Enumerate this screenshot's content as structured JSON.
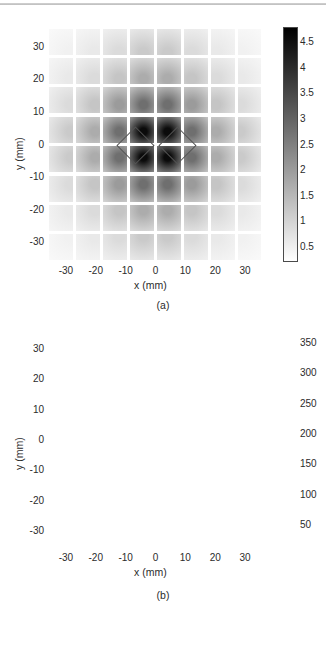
{
  "figure": {
    "width": 326,
    "height": 645,
    "background": "#ffffff"
  },
  "panels": [
    {
      "id": "a",
      "caption": "(a)",
      "xlabel": "x (mm)",
      "ylabel": "y (mm)",
      "xticks": [
        "-30",
        "-20",
        "-10",
        "0",
        "10",
        "20",
        "30"
      ],
      "xtick_values": [
        -30,
        -20,
        -10,
        0,
        10,
        20,
        30
      ],
      "yticks": [
        "30",
        "20",
        "10",
        "0",
        "-10",
        "-20",
        "-30"
      ],
      "ytick_values": [
        30,
        20,
        10,
        0,
        -10,
        -20,
        -30
      ],
      "colorbar": {
        "ticks": [
          "4.5",
          "4",
          "3.5",
          "3",
          "2.5",
          "2",
          "1.5",
          "1",
          "0.5"
        ],
        "tick_values": [
          4.5,
          4,
          3.5,
          3,
          2.5,
          2,
          1.5,
          1,
          0.5
        ],
        "min": 0.2,
        "max": 4.8,
        "low_color": "#ffffff",
        "high_color": "#000000",
        "orientation": "vertical"
      },
      "overlay": "two-diamond-outline",
      "overlay_color": "#555555"
    },
    {
      "id": "b",
      "caption": "(b)",
      "xlabel": "x (mm)",
      "ylabel": "y (mm)",
      "xticks": [
        "-30",
        "-20",
        "-10",
        "0",
        "10",
        "20",
        "30"
      ],
      "xtick_values": [
        -30,
        -20,
        -10,
        0,
        10,
        20,
        30
      ],
      "yticks": [
        "30",
        "20",
        "10",
        "0",
        "-10",
        "-20",
        "-30"
      ],
      "ytick_values": [
        30,
        20,
        10,
        0,
        -10,
        -20,
        -30
      ],
      "colorbar": {
        "ticks": [
          "350",
          "300",
          "250",
          "200",
          "150",
          "100",
          "50"
        ],
        "tick_values": [
          350,
          300,
          250,
          200,
          150,
          100,
          50
        ],
        "min": 10,
        "max": 370,
        "low_color": "#ffffff",
        "high_color": "#000000",
        "orientation": "vertical"
      },
      "overlay": "two-diamond-outline",
      "overlay_color": "#888888",
      "outside_field_color": "#000000",
      "field_radius_mm": 32
    }
  ],
  "chart_data": [
    {
      "type": "heatmap",
      "panel": "a",
      "title": "",
      "xlabel": "x (mm)",
      "ylabel": "y (mm)",
      "xlim": [
        -36,
        36
      ],
      "ylim": [
        -36,
        36
      ],
      "xticks": [
        -30,
        -20,
        -10,
        0,
        10,
        20,
        30
      ],
      "yticks": [
        -30,
        -20,
        -10,
        0,
        10,
        20,
        30
      ],
      "grid": false,
      "colorbar_label": "",
      "cmap": "gray_r",
      "clim": [
        0.2,
        4.8
      ],
      "block_grid": 8,
      "block_pitch_mm": 9.0,
      "block_gap_mm": 1.0,
      "comment": "8x8 array of detector blocks; intensity peaks at center and falls off radially",
      "x_centers_mm": [
        -31.5,
        -22.5,
        -13.5,
        -4.5,
        4.5,
        13.5,
        22.5,
        31.5
      ],
      "y_centers_mm": [
        31.5,
        22.5,
        13.5,
        4.5,
        -4.5,
        -13.5,
        -22.5,
        -31.5
      ],
      "values": [
        [
          0.45,
          0.6,
          0.85,
          1.15,
          1.15,
          0.85,
          0.6,
          0.45
        ],
        [
          0.6,
          0.85,
          1.25,
          1.7,
          1.7,
          1.25,
          0.85,
          0.6
        ],
        [
          0.85,
          1.25,
          2.0,
          2.8,
          2.8,
          2.0,
          1.25,
          0.85
        ],
        [
          1.15,
          1.7,
          2.8,
          4.6,
          4.6,
          2.8,
          1.7,
          1.15
        ],
        [
          1.15,
          1.7,
          2.8,
          4.6,
          4.6,
          2.8,
          1.7,
          1.15
        ],
        [
          0.85,
          1.25,
          2.0,
          2.8,
          2.8,
          2.0,
          1.25,
          0.85
        ],
        [
          0.6,
          0.85,
          1.25,
          1.7,
          1.7,
          1.25,
          0.85,
          0.6
        ],
        [
          0.45,
          0.6,
          0.85,
          1.15,
          1.15,
          0.85,
          0.6,
          0.45
        ]
      ]
    },
    {
      "type": "heatmap",
      "panel": "b",
      "title": "",
      "xlabel": "x (mm)",
      "ylabel": "y (mm)",
      "xlim": [
        -36,
        36
      ],
      "ylim": [
        -36,
        36
      ],
      "xticks": [
        -30,
        -20,
        -10,
        0,
        10,
        20,
        30
      ],
      "yticks": [
        -30,
        -20,
        -10,
        0,
        10,
        20,
        30
      ],
      "grid": false,
      "colorbar_label": "",
      "cmap": "gray_r",
      "clim": [
        10,
        370
      ],
      "block_grid": 8,
      "block_pitch_mm": 9.0,
      "block_gap_mm": 1.0,
      "field_of_view_radius_mm": 32,
      "comment": "Same 8x8 block array; saturated black outside circular field of view",
      "x_centers_mm": [
        -31.5,
        -22.5,
        -13.5,
        -4.5,
        4.5,
        13.5,
        22.5,
        31.5
      ],
      "y_centers_mm": [
        31.5,
        22.5,
        13.5,
        4.5,
        -4.5,
        -13.5,
        -22.5,
        -31.5
      ],
      "values": [
        [
          370,
          370,
          55,
          70,
          70,
          55,
          370,
          370
        ],
        [
          370,
          110,
          95,
          125,
          125,
          95,
          110,
          370
        ],
        [
          130,
          130,
          185,
          215,
          215,
          185,
          130,
          130
        ],
        [
          85,
          150,
          300,
          370,
          370,
          300,
          150,
          85
        ],
        [
          85,
          150,
          300,
          370,
          370,
          300,
          150,
          85
        ],
        [
          130,
          130,
          185,
          215,
          215,
          185,
          130,
          130
        ],
        [
          370,
          110,
          95,
          125,
          125,
          95,
          110,
          370
        ],
        [
          370,
          370,
          55,
          70,
          70,
          55,
          370,
          370
        ]
      ]
    }
  ]
}
